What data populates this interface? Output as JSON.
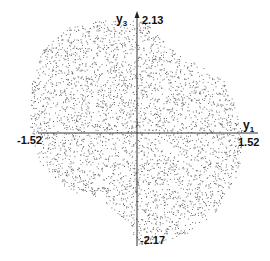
{
  "chart_data": {
    "type": "scatter",
    "title": "",
    "xlabel": "y1",
    "ylabel": "y3",
    "x_axis": {
      "min_label": "-1.52",
      "max_label": "1.52",
      "range": [
        -1.52,
        1.52
      ]
    },
    "y_axis": {
      "min_label": "-2.17",
      "max_label": "2.13",
      "range": [
        -2.17,
        2.13
      ]
    },
    "grid": false,
    "legend": null,
    "point_color": "#555555",
    "point_count_approx": 3500,
    "boundary_approx": [
      [
        -1.3,
        1.55
      ],
      [
        -1.0,
        1.9
      ],
      [
        -0.55,
        2.05
      ],
      [
        -0.05,
        2.05
      ],
      [
        0.1,
        2.05
      ],
      [
        0.45,
        1.55
      ],
      [
        0.9,
        1.2
      ],
      [
        1.2,
        0.95
      ],
      [
        1.35,
        0.6
      ],
      [
        1.45,
        0.05
      ],
      [
        1.42,
        -0.6
      ],
      [
        1.35,
        -0.9
      ],
      [
        1.05,
        -1.55
      ],
      [
        0.7,
        -1.9
      ],
      [
        0.3,
        -2.07
      ],
      [
        0.05,
        -2.1
      ],
      [
        -0.05,
        -2.0
      ],
      [
        -0.1,
        -1.75
      ],
      [
        -0.5,
        -1.25
      ],
      [
        -0.95,
        -1.08
      ],
      [
        -1.35,
        -0.55
      ],
      [
        -1.48,
        0.1
      ],
      [
        -1.45,
        0.95
      ]
    ]
  },
  "labels": {
    "x_axis_name": "y",
    "x_axis_sub": "1",
    "y_axis_name": "y",
    "y_axis_sub": "3",
    "x_min": "-1.52",
    "x_max": "1.52",
    "y_max": "2.13",
    "y_min": "-2.17"
  }
}
